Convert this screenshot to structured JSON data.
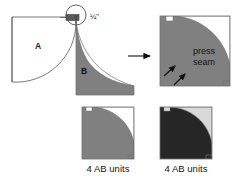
{
  "figure": {
    "background_color": "#ffffff"
  },
  "colors": {
    "fabric_a_white": "#ffffff",
    "fabric_b_gray": "#808080",
    "fabric_b_dark": "#262626",
    "fabric_light_gray": "#d8d8d8",
    "outline": "#4d4d4d",
    "ink": "#141414"
  },
  "labels": {
    "piece_a": "A",
    "piece_b": "B",
    "seam_allowance": "¼\"",
    "press_line1": "press",
    "press_line2": "seam",
    "caption_left": "4 AB units",
    "caption_right": "4 AB units"
  },
  "icons": {
    "detail_circle": "magnifier-circle-icon",
    "process_arrow": "right-arrow-icon",
    "press_arrow_1": "up-right-arrow-icon",
    "press_arrow_2": "up-right-arrow-icon"
  },
  "panels": [
    {
      "id": "panel-pieces",
      "name": "pieces-a-and-b",
      "description": "Piece A white square with concave curved edge joined to gray piece B wedge, with ¼\" seam allowance detail circle"
    },
    {
      "id": "panel-pressed",
      "name": "pressed-unit",
      "description": "Sewn AB unit with gray outer L region and white quarter-circle, press seam toward B"
    },
    {
      "id": "panel-unit-light",
      "name": "ab-unit-light",
      "description": "Finished AB unit, gray and white, 4 AB units"
    },
    {
      "id": "panel-unit-dark",
      "name": "ab-unit-dark",
      "description": "Finished AB unit, dark and light gray, 4 AB units"
    }
  ]
}
